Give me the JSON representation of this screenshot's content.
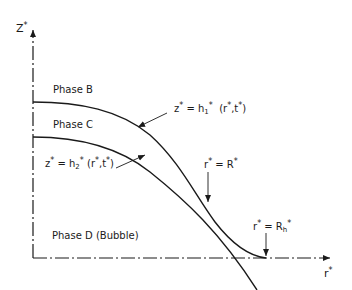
{
  "axes": {
    "z_label": "Z",
    "z_star": "*",
    "r_label": "r",
    "r_star": "*"
  },
  "phases": {
    "b": "Phase B",
    "c": "Phase C",
    "d": "Phase D (Bubble)"
  },
  "equations": {
    "h1": {
      "lhs": "z",
      "star": "*",
      "eq": " = h",
      "sub": "1",
      "args": " (r",
      "args2": ",t",
      "close": ")"
    },
    "h2": {
      "lhs": "z",
      "star": "*",
      "eq": " = h",
      "sub": "2",
      "args": " (r",
      "args2": ",t",
      "close": ")"
    },
    "R": {
      "lhs": "r",
      "star": "*",
      "eq": " = R"
    },
    "Rh": {
      "lhs": "r",
      "star": "*",
      "eq": " = R",
      "sub": "h"
    }
  },
  "colors": {
    "line": "#1a1a1a",
    "background": "#ffffff"
  }
}
